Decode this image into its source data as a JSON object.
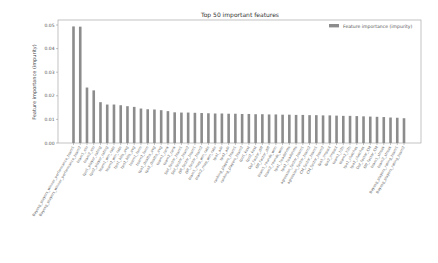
{
  "chart_data": {
    "type": "bar",
    "title": "Top 50 important features",
    "xlabel": "",
    "ylabel": "Feature importance (impurity)",
    "ylim": [
      0.0,
      0.05
    ],
    "yticks": [
      "0.00",
      "0.01",
      "0.02",
      "0.03",
      "0.04",
      "0.05"
    ],
    "grid": false,
    "legend_position": "upper right",
    "bar_color": "#8c8c8c",
    "series": [
      {
        "name": "Feature importance (impurity)",
        "values": [
          0.0494,
          0.0493,
          0.0235,
          0.0223,
          0.0173,
          0.0163,
          0.0163,
          0.016,
          0.0156,
          0.0153,
          0.0146,
          0.0143,
          0.0142,
          0.0139,
          0.0135,
          0.013,
          0.0129,
          0.0129,
          0.0128,
          0.0127,
          0.0126,
          0.0125,
          0.0125,
          0.0124,
          0.0124,
          0.0123,
          0.0123,
          0.0122,
          0.0122,
          0.0121,
          0.0121,
          0.012,
          0.012,
          0.0119,
          0.0119,
          0.0118,
          0.0118,
          0.0117,
          0.0117,
          0.0116,
          0.0115,
          0.0115,
          0.0114,
          0.0113,
          0.0112,
          0.0111,
          0.011,
          0.0108,
          0.0107,
          0.0105
        ]
      }
    ],
    "categories": [
      "Bayesg_players_winner_performance_team1",
      "Bayesg_players_winner_performance_team2",
      "team1_elo",
      "team2_elo",
      "tpo1_player_rating",
      "tpo2_player_rating",
      "team1_win_rate",
      "team2_win_rate",
      "tpo1_kills_avg",
      "tpo2_kills_avg",
      "team1_form",
      "team2_form",
      "tpo1_deaths_avg",
      "tpo2_deaths_avg",
      "team1_rank",
      "team2_rank",
      "Def_factor_team1",
      "Def_factor_team2",
      "Off_factor_team1",
      "Off_factor_team2",
      "team1_map_win_rate",
      "team2_map_win_rate",
      "tpo1_adr",
      "tpo2_adr",
      "ranking_players_team1",
      "ranking_players_team2",
      "tpo1_kast",
      "tpo2_kast",
      "Def_factor_diff",
      "Off_factor_diff",
      "team1_rounds_won",
      "team2_rounds_won",
      "tpo1_headshots",
      "tpo2_headshots",
      "agression_factor_team1",
      "agression_factor_team2",
      "CM_factor_team1",
      "CM_factor_team2",
      "tpo1_impact",
      "tpo2_impact",
      "team1_h2h",
      "team2_h2h",
      "tpo1_clutches",
      "tpo2_clutches",
      "Def_factor_CM",
      "Off_factor_CM",
      "team1_streak",
      "team2_streak",
      "Bayesg_players_rating_team1",
      "Bayesg_players_rating_team2"
    ]
  }
}
